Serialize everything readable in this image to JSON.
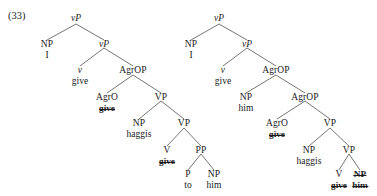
{
  "figure": {
    "example_number": "(33)",
    "domain": "syntax-tree-diagram",
    "trees": [
      {
        "id": "tree-left",
        "nodes": [
          {
            "key": "t1_vP_root",
            "cat": "vP",
            "lex": null,
            "cat_italic_v": true,
            "cat_struck": false,
            "lex_struck": false
          },
          {
            "key": "t1_NP_subj",
            "cat": "NP",
            "lex": "I",
            "cat_italic_v": false,
            "cat_struck": false,
            "lex_struck": false
          },
          {
            "key": "t1_vP_bar",
            "cat": "vP",
            "lex": null,
            "cat_italic_v": true,
            "cat_struck": false,
            "lex_struck": false
          },
          {
            "key": "t1_v_head",
            "cat": "v",
            "lex": "give",
            "cat_italic_v": true,
            "cat_struck": false,
            "lex_struck": false
          },
          {
            "key": "t1_AgrOP",
            "cat": "AgrOP",
            "lex": null,
            "cat_italic_v": false,
            "cat_struck": false,
            "lex_struck": false
          },
          {
            "key": "t1_AgrO",
            "cat": "AgrO",
            "lex": "give",
            "cat_italic_v": false,
            "cat_struck": false,
            "lex_struck": true
          },
          {
            "key": "t1_VP_hi",
            "cat": "VP",
            "lex": null,
            "cat_italic_v": false,
            "cat_struck": false,
            "lex_struck": false
          },
          {
            "key": "t1_NP_haggis",
            "cat": "NP",
            "lex": "haggis",
            "cat_italic_v": false,
            "cat_struck": false,
            "lex_struck": false
          },
          {
            "key": "t1_VP_lo",
            "cat": "VP",
            "lex": null,
            "cat_italic_v": false,
            "cat_struck": false,
            "lex_struck": false
          },
          {
            "key": "t1_V",
            "cat": "V",
            "lex": "give",
            "cat_italic_v": false,
            "cat_struck": false,
            "lex_struck": true
          },
          {
            "key": "t1_PP",
            "cat": "PP",
            "lex": null,
            "cat_italic_v": false,
            "cat_struck": false,
            "lex_struck": false
          },
          {
            "key": "t1_P",
            "cat": "P",
            "lex": "to",
            "cat_italic_v": false,
            "cat_struck": false,
            "lex_struck": false
          },
          {
            "key": "t1_NP_him",
            "cat": "NP",
            "lex": "him",
            "cat_italic_v": false,
            "cat_struck": false,
            "lex_struck": false
          }
        ]
      },
      {
        "id": "tree-right",
        "nodes": [
          {
            "key": "t2_vP_root",
            "cat": "vP",
            "lex": null,
            "cat_italic_v": true,
            "cat_struck": false,
            "lex_struck": false
          },
          {
            "key": "t2_NP_subj",
            "cat": "NP",
            "lex": "I",
            "cat_italic_v": false,
            "cat_struck": false,
            "lex_struck": false
          },
          {
            "key": "t2_vP_bar",
            "cat": "vP",
            "lex": null,
            "cat_italic_v": true,
            "cat_struck": false,
            "lex_struck": false
          },
          {
            "key": "t2_v_head",
            "cat": "v",
            "lex": "give",
            "cat_italic_v": true,
            "cat_struck": false,
            "lex_struck": false
          },
          {
            "key": "t2_AgrOP_hi",
            "cat": "AgrOP",
            "lex": null,
            "cat_italic_v": false,
            "cat_struck": false,
            "lex_struck": false
          },
          {
            "key": "t2_NP_him_spec",
            "cat": "NP",
            "lex": "him",
            "cat_italic_v": false,
            "cat_struck": false,
            "lex_struck": false
          },
          {
            "key": "t2_AgrOP_lo",
            "cat": "AgrOP",
            "lex": null,
            "cat_italic_v": false,
            "cat_struck": false,
            "lex_struck": false
          },
          {
            "key": "t2_AgrO",
            "cat": "AgrO",
            "lex": "give",
            "cat_italic_v": false,
            "cat_struck": false,
            "lex_struck": true
          },
          {
            "key": "t2_VP_hi",
            "cat": "VP",
            "lex": null,
            "cat_italic_v": false,
            "cat_struck": false,
            "lex_struck": false
          },
          {
            "key": "t2_NP_haggis",
            "cat": "NP",
            "lex": "haggis",
            "cat_italic_v": false,
            "cat_struck": false,
            "lex_struck": false
          },
          {
            "key": "t2_VP_lo",
            "cat": "VP",
            "lex": null,
            "cat_italic_v": false,
            "cat_struck": false,
            "lex_struck": false
          },
          {
            "key": "t2_V",
            "cat": "V",
            "lex": "give",
            "cat_italic_v": false,
            "cat_struck": false,
            "lex_struck": true
          },
          {
            "key": "t2_NP_trace",
            "cat": "NP",
            "lex": "him",
            "cat_italic_v": false,
            "cat_struck": true,
            "lex_struck": true
          }
        ]
      }
    ],
    "colors": {
      "ink": "#1a1a1a",
      "line": "#3a3a3a",
      "background": "#ffffff"
    }
  }
}
